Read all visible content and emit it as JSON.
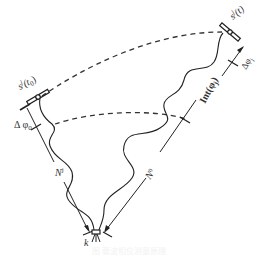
{
  "diagram": {
    "type": "satellite-signal-geometry",
    "labels": {
      "sat_start": "s",
      "sat_start_sup": "j",
      "sat_start_arg": "(t",
      "sat_start_sub": "0",
      "sat_start_close": ")",
      "sat_end": "s",
      "sat_end_sup": "j",
      "sat_end_arg": "(t)",
      "delta_phi0": "Δ φ",
      "delta_phi0_sub": "0",
      "delta_phij": "Δφ",
      "delta_phij_sub": "j",
      "int_phij": "Int(φ",
      "int_phij_sub": "j",
      "int_phij_close": ")",
      "n_j": "N",
      "n_j_sup": "j",
      "n_0": "N",
      "n_0_sub": "0",
      "receiver": "k"
    },
    "nodes": [
      {
        "id": "satellite-t0",
        "label": "s^j(t0)"
      },
      {
        "id": "satellite-t",
        "label": "s^j(t)"
      },
      {
        "id": "receiver",
        "label": "k"
      }
    ],
    "edges": [
      {
        "from": "satellite-t0",
        "to": "satellite-t",
        "style": "dashed",
        "meaning": "satellite orbit arc"
      },
      {
        "from": "satellite-t0",
        "to": "receiver",
        "style": "wavy",
        "meaning": "signal path"
      },
      {
        "from": "satellite-t",
        "to": "receiver",
        "style": "wavy",
        "meaning": "signal path"
      },
      {
        "from": "satellite-t0",
        "to": "receiver",
        "style": "arrow",
        "label": "N^j"
      },
      {
        "from": "satellite-t",
        "to": "receiver",
        "style": "arrow",
        "label": "N0 + Int(φj) + Δφj"
      }
    ],
    "caption": "图 载波相位测量原理"
  }
}
